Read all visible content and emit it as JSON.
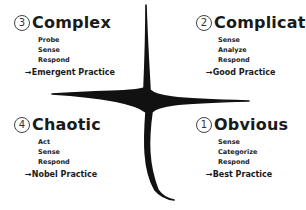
{
  "domains": [
    {
      "id": "complex",
      "number": "3",
      "title": "Complex",
      "steps": [
        "Probe",
        "Sense",
        "Respond"
      ],
      "practice": "→Emergent Practice"
    },
    {
      "id": "complicated",
      "number": "2",
      "title": "Complicated",
      "steps": [
        "Sense",
        "Analyze",
        "Respond"
      ],
      "practice": "→Good Practice"
    },
    {
      "id": "chaotic",
      "number": "4",
      "title": "Chaotic",
      "steps": [
        "Act",
        "Sense",
        "Respond"
      ],
      "practice": "→Nobel Practice"
    },
    {
      "id": "obvious",
      "number": "1",
      "title": "Obvious",
      "steps": [
        "Sense",
        "Categorize",
        "Respond"
      ],
      "practice": "→Best Practice"
    }
  ],
  "colors": {
    "ink": "#111111",
    "background": "#ffffff"
  }
}
